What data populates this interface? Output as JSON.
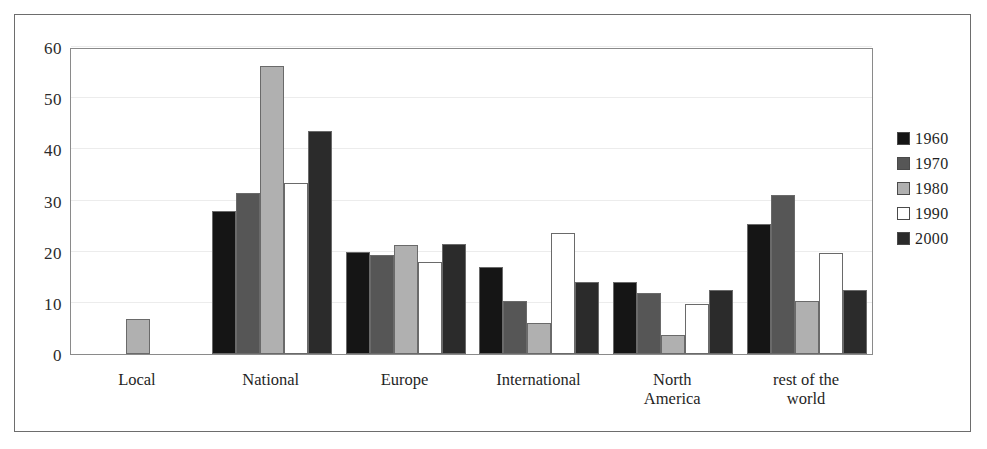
{
  "chart_data": {
    "type": "bar",
    "title": "",
    "subtitle": "",
    "xlabel": "",
    "ylabel": "",
    "ylim": [
      0,
      60
    ],
    "yticks": [
      0,
      10,
      20,
      30,
      40,
      50,
      60
    ],
    "ytick_labels": [
      "0",
      "10",
      "20",
      "30",
      "40",
      "50",
      "60"
    ],
    "grid": true,
    "grid_axis": "y",
    "legend_position": "right",
    "categories": [
      "Local",
      "National",
      "Europe",
      "International",
      "North America",
      "rest of the world"
    ],
    "category_label_lines": [
      [
        "Local"
      ],
      [
        "National"
      ],
      [
        "Europe"
      ],
      [
        "International"
      ],
      [
        "North",
        "America"
      ],
      [
        "rest of the",
        "world"
      ]
    ],
    "series": [
      {
        "name": "1960",
        "color": "#151515",
        "values": [
          0,
          28.0,
          20.0,
          17.0,
          14.0,
          25.5
        ]
      },
      {
        "name": "1970",
        "color": "#565656",
        "values": [
          0,
          31.5,
          19.3,
          10.3,
          12.0,
          31.0
        ]
      },
      {
        "name": "1980",
        "color": "#b0b0b0",
        "values": [
          6.8,
          56.2,
          21.3,
          6.0,
          3.7,
          10.3
        ]
      },
      {
        "name": "1990",
        "color": "#ffffff",
        "values": [
          0,
          33.5,
          18.0,
          23.7,
          9.7,
          19.8
        ]
      },
      {
        "name": "2000",
        "color": "#2b2b2b",
        "values": [
          0,
          43.6,
          21.5,
          14.0,
          12.5,
          12.5
        ]
      }
    ]
  },
  "legend": {
    "entries": [
      {
        "label": "1960",
        "color": "#151515"
      },
      {
        "label": "1970",
        "color": "#565656"
      },
      {
        "label": "1980",
        "color": "#b0b0b0"
      },
      {
        "label": "1990",
        "color": "#ffffff"
      },
      {
        "label": "2000",
        "color": "#2b2b2b"
      }
    ]
  },
  "colors": {
    "frame": "#6d6d6d",
    "axis": "#8a8a8a",
    "gridline": "#ececec",
    "bar_outline": "#6a6a6a",
    "background": "#ffffff",
    "text": "#1f1f1f"
  }
}
